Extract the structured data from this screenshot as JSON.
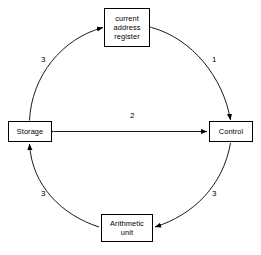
{
  "diagram": {
    "background_color": "#ffffff",
    "line_color": "#000000",
    "text_color": "#000000",
    "nodes": [
      {
        "id": "current-address-register",
        "label": "current address register",
        "lines": [
          "current",
          "address",
          "register"
        ],
        "position": "top"
      },
      {
        "id": "storage",
        "label": "Storage",
        "lines": [
          "Storage"
        ],
        "position": "left"
      },
      {
        "id": "control",
        "label": "Control",
        "lines": [
          "Control"
        ],
        "position": "right"
      },
      {
        "id": "arithmetic-unit",
        "label": "Arithmetic unit",
        "lines": [
          "Arithmetic",
          "unit"
        ],
        "position": "bottom"
      }
    ],
    "edges": [
      {
        "id": "storage-to-register",
        "label": "3",
        "from": "storage",
        "to": "current-address-register",
        "shape": "arc",
        "arrowheads": "single"
      },
      {
        "id": "register-to-control",
        "label": "1",
        "from": "current-address-register",
        "to": "control",
        "shape": "arc",
        "arrowheads": "double"
      },
      {
        "id": "storage-control-link",
        "label": "2",
        "from": "storage",
        "to": "control",
        "shape": "straight",
        "arrowheads": "double"
      },
      {
        "id": "control-to-arithmetic",
        "label": "3",
        "from": "control",
        "to": "arithmetic-unit",
        "shape": "arc",
        "arrowheads": "single"
      },
      {
        "id": "arithmetic-to-storage",
        "label": "3",
        "from": "arithmetic-unit",
        "to": "storage",
        "shape": "arc",
        "arrowheads": "single"
      }
    ]
  }
}
